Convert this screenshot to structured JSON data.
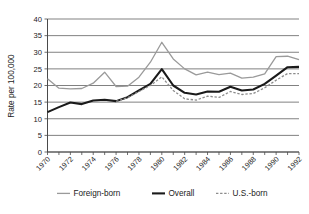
{
  "chart_data": {
    "type": "line",
    "title": "",
    "xlabel": "",
    "ylabel": "Rate per 100,000",
    "xlim": [
      1970,
      1992
    ],
    "ylim": [
      0,
      40
    ],
    "yticks": [
      0,
      5,
      10,
      15,
      20,
      25,
      30,
      35,
      40
    ],
    "ytick_labels": [
      "0",
      "5",
      "10",
      "15",
      "20",
      "25",
      "30",
      "35",
      "40"
    ],
    "xticks": [
      1970,
      1971,
      1972,
      1973,
      1974,
      1975,
      1976,
      1977,
      1978,
      1979,
      1980,
      1981,
      1982,
      1983,
      1984,
      1985,
      1986,
      1987,
      1988,
      1989,
      1990,
      1991,
      1992
    ],
    "xtick_labels": [
      "1970",
      "",
      "1972",
      "",
      "1974",
      "",
      "1976",
      "",
      "1978",
      "",
      "1980",
      "",
      "1982",
      "",
      "1984",
      "",
      "1986",
      "",
      "1988",
      "",
      "1990",
      "",
      "1992"
    ],
    "xtick_labels_shown": [
      "1970",
      "1972",
      "1974",
      "1976",
      "1978",
      "1980",
      "1982",
      "1984",
      "1986",
      "1988",
      "1990",
      "1992"
    ],
    "grid": true,
    "grid_axis": "y",
    "legend_position": "bottom",
    "x": [
      1970,
      1971,
      1972,
      1973,
      1974,
      1975,
      1976,
      1977,
      1978,
      1979,
      1980,
      1981,
      1982,
      1983,
      1984,
      1985,
      1986,
      1987,
      1988,
      1989,
      1990,
      1991,
      1992
    ],
    "series": [
      {
        "name": "Foreign-born",
        "style": "solid",
        "color": "#9a9a9a",
        "width": 1.3,
        "x": [
          1970,
          1971,
          1972,
          1973,
          1974,
          1975,
          1976,
          1977,
          1978,
          1979,
          1980,
          1981,
          1982,
          1983,
          1984,
          1985,
          1986,
          1987,
          1988,
          1989,
          1990,
          1991,
          1992
        ],
        "values": [
          22.0,
          19.2,
          19.0,
          19.1,
          20.7,
          24.0,
          19.7,
          19.8,
          22.5,
          27.0,
          33.0,
          28.0,
          25.0,
          23.2,
          24.0,
          23.3,
          23.7,
          22.2,
          22.5,
          23.5,
          28.7,
          28.8,
          27.8
        ]
      },
      {
        "name": "Overall",
        "style": "solid",
        "color": "#1a1a1a",
        "width": 2.1,
        "x": [
          1970,
          1971,
          1972,
          1973,
          1974,
          1975,
          1976,
          1977,
          1978,
          1979,
          1980,
          1981,
          1982,
          1983,
          1984,
          1985,
          1986,
          1987,
          1988,
          1989,
          1990,
          1991,
          1992
        ],
        "values": [
          12.0,
          13.5,
          14.9,
          14.4,
          15.5,
          15.7,
          15.3,
          16.5,
          18.5,
          20.5,
          24.9,
          20.0,
          17.8,
          17.3,
          18.2,
          18.1,
          19.6,
          18.5,
          18.8,
          20.5,
          23.0,
          25.5,
          25.6
        ]
      },
      {
        "name": "U.S.-born",
        "style": "dashed",
        "color": "#8c8c8c",
        "width": 1.3,
        "x": [
          1976,
          1977,
          1978,
          1979,
          1980,
          1981,
          1982,
          1983,
          1984,
          1985,
          1986,
          1987,
          1988,
          1989,
          1990,
          1991,
          1992
        ],
        "values": [
          15.2,
          16.3,
          18.2,
          20.0,
          22.6,
          18.5,
          16.0,
          15.6,
          16.8,
          16.4,
          18.2,
          17.3,
          17.6,
          19.3,
          21.6,
          23.6,
          23.6
        ]
      }
    ]
  },
  "legend": {
    "items": [
      {
        "label": "Foreign-born",
        "swatch": "solid-gray"
      },
      {
        "label": "Overall",
        "swatch": "solid-black"
      },
      {
        "label": "U.S.-born",
        "swatch": "dashed-gray"
      }
    ]
  },
  "axes": {
    "y_title": "Rate per 100,000"
  }
}
